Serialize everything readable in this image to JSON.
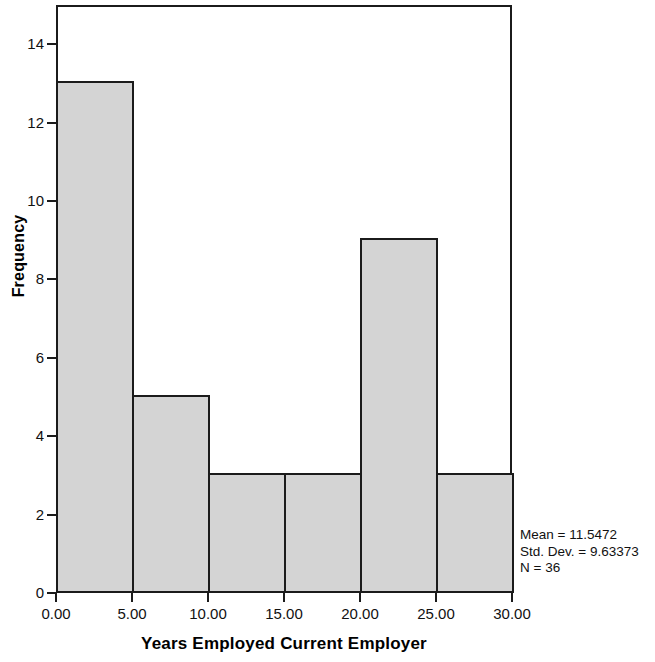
{
  "chart_data": {
    "type": "bar",
    "title": "",
    "subtitle": "",
    "xlabel": "Years Employed Current Employer",
    "ylabel": "Frequency",
    "categories": [
      "0-5",
      "5-10",
      "10-15",
      "15-20",
      "20-25",
      "25-30"
    ],
    "bin_edges": [
      0,
      5,
      10,
      15,
      20,
      25,
      30
    ],
    "values": [
      13,
      5,
      3,
      3,
      9,
      3
    ],
    "xlim": [
      0,
      30
    ],
    "ylim": [
      0,
      15
    ],
    "x_ticks": [
      0,
      5,
      10,
      15,
      20,
      25,
      30
    ],
    "x_tick_labels": [
      "0.00",
      "5.00",
      "10.00",
      "15.00",
      "20.00",
      "25.00",
      "30.00"
    ],
    "y_ticks": [
      0,
      2,
      4,
      6,
      8,
      10,
      12,
      14
    ],
    "y_tick_labels": [
      "0",
      "2",
      "4",
      "6",
      "8",
      "10",
      "12",
      "14"
    ],
    "grid": false,
    "legend": false,
    "bar_fill_color": "#d4d4d4",
    "bar_edge_color": "#1b1b1b",
    "background_color": "#ffffff"
  },
  "annotations": {
    "stats": {
      "mean": "Mean = 11.5472",
      "std_dev": "Std. Dev. = 9.63373",
      "n": "N = 36"
    }
  }
}
